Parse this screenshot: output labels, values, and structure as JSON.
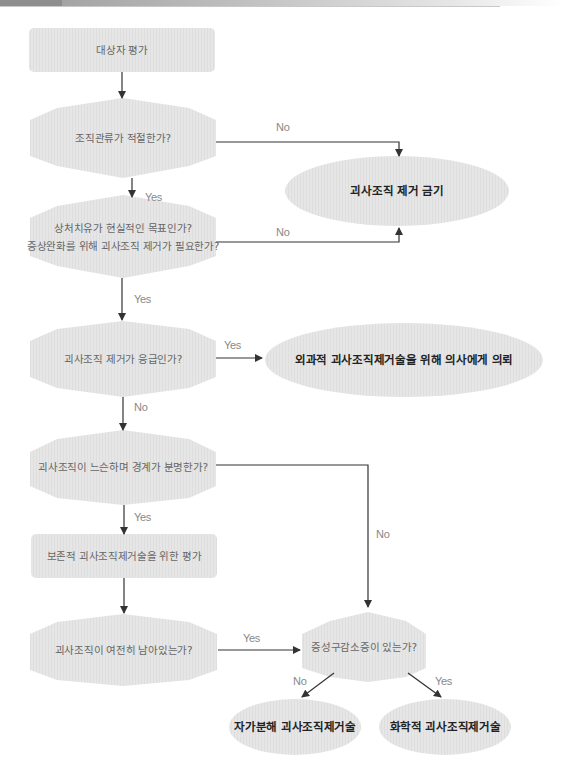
{
  "header": {
    "bar": "decorative page header bar"
  },
  "nodes": {
    "assess": "대상자 평가",
    "perfusion": "조직관류가 적절한가?",
    "healing_line1": "상처치유가 현실적인 목표인가?",
    "healing_line2": "증상완화를 위해 괴사조직 제거가 필요한가?",
    "contraindicated": "괴사조직 제거 금기",
    "urgent": "괴사조직 제거가 응급인가?",
    "refer": "외과적 괴사조직제거술을 위해 의사에게 의뢰",
    "loose": "괴사조직이 느슨하며 경계가 분명한가?",
    "conservative": "보존적 괴사조직제거술을 위한 평가",
    "remaining": "괴사조직이 여전히 남아있는가?",
    "infection": "증성구감소증이 있는가?",
    "autolytic": "자가분해 괴사조직제거술",
    "chemical": "화학적 괴사조직제거술"
  },
  "edges": {
    "perfusion_no": "No",
    "perfusion_yes": "Yes",
    "healing_no": "No",
    "healing_yes": "Yes",
    "urgent_yes": "Yes",
    "urgent_no": "No",
    "loose_yes": "Yes",
    "loose_no": "No",
    "remaining_yes": "Yes",
    "infection_no": "No",
    "infection_yes": "Yes"
  },
  "colors": {
    "shape_fill": "#e4e4e4",
    "line": "#333333",
    "text": "#666666",
    "bold_text": "#222222"
  }
}
